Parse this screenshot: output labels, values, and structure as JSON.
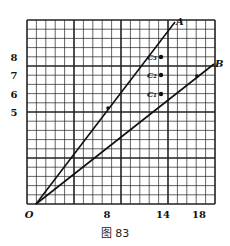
{
  "figure": {
    "caption": "图 83",
    "origin_label": "O",
    "x_tick_labels": [
      {
        "value": 8,
        "label": "8",
        "x": 107
      },
      {
        "value": 14,
        "label": "14",
        "x": 163
      },
      {
        "value": 18,
        "label": "18",
        "x": 199
      }
    ],
    "y_tick_labels": [
      {
        "value": 8,
        "label": "8",
        "y": 57
      },
      {
        "value": 7,
        "label": "7",
        "y": 75
      },
      {
        "value": 6,
        "label": "6",
        "y": 94
      },
      {
        "value": 5,
        "label": "5",
        "y": 112
      }
    ],
    "lines": [
      {
        "label": "A",
        "x1": 36,
        "y1": 204,
        "x2": 175,
        "y2": 22
      },
      {
        "label": "B",
        "x1": 36,
        "y1": 204,
        "x2": 214,
        "y2": 64
      }
    ],
    "points": [
      {
        "label": "C3",
        "display": "C₃",
        "x": 161,
        "y": 57
      },
      {
        "label": "C2",
        "display": "C₂",
        "x": 161,
        "y": 75
      },
      {
        "label": "C1",
        "display": "C₁",
        "x": 161,
        "y": 94
      }
    ],
    "line_markers": [
      {
        "on": "A",
        "x": 108,
        "y": 108
      },
      {
        "on": "B",
        "x": 197,
        "y": 76
      }
    ],
    "colors": {
      "ink": "#111111",
      "grid": "#222222",
      "background": "#ffffff"
    }
  }
}
